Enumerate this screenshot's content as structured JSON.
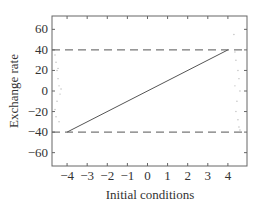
{
  "chart_data": {
    "type": "line",
    "title": "",
    "xlabel": "Initial conditions",
    "ylabel": "Exchange rate",
    "xlim": [
      -4.75,
      4.95
    ],
    "ylim": [
      -73,
      73
    ],
    "xticks": [
      -4,
      -3,
      -2,
      -1,
      0,
      1,
      2,
      3,
      4
    ],
    "xtick_labels": [
      "−4",
      "−3",
      "−2",
      "−1",
      "0",
      "1",
      "2",
      "3",
      "4"
    ],
    "yticks": [
      60,
      40,
      20,
      0,
      -20,
      -40,
      -60
    ],
    "ytick_labels": [
      "60",
      "40",
      "20",
      "0",
      "−20",
      "−40",
      "−60"
    ],
    "grid": false,
    "legend": null,
    "series": [
      {
        "name": "solution line",
        "style": "solid",
        "color": "#555555",
        "x": [
          -4,
          4
        ],
        "y": [
          -40,
          40
        ]
      },
      {
        "name": "upper bound",
        "style": "dashed",
        "color": "#555555",
        "x": [
          -4.75,
          4.95
        ],
        "y": [
          40,
          40
        ]
      },
      {
        "name": "lower bound",
        "style": "dashed",
        "color": "#555555",
        "x": [
          -4.75,
          4.95
        ],
        "y": [
          -40,
          -40
        ]
      },
      {
        "name": "left scatter",
        "style": "scatter",
        "color": "#bbbbbb",
        "x": [
          -4.6,
          -4.55,
          -4.5,
          -4.45,
          -4.4,
          -4.35,
          -4.5,
          -4.6,
          -4.55,
          -4.4,
          -4.3,
          -4.45
        ],
        "y": [
          35,
          28,
          20,
          12,
          5,
          -3,
          -10,
          -18,
          -25,
          -30,
          2,
          22
        ]
      },
      {
        "name": "right scatter",
        "style": "scatter",
        "color": "#bbbbbb",
        "x": [
          4.3,
          4.35,
          4.4,
          4.5,
          4.55,
          4.6,
          4.45,
          4.4,
          4.5,
          4.55,
          4.35,
          4.6
        ],
        "y": [
          55,
          38,
          30,
          20,
          12,
          0,
          -10,
          -20,
          -28,
          -35,
          5,
          -38
        ]
      }
    ]
  }
}
